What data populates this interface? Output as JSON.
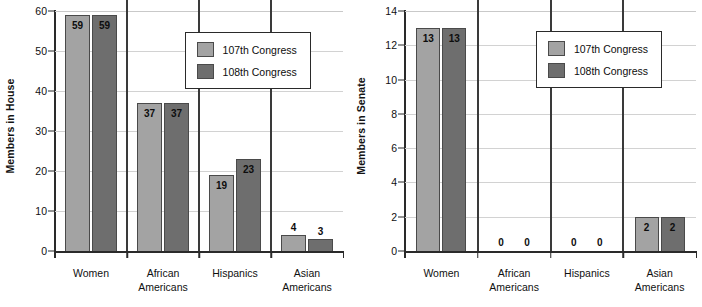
{
  "chart_data": [
    {
      "type": "bar",
      "id": "house",
      "title": "",
      "xlabel": "",
      "ylabel": "Members in House",
      "ylim": [
        0,
        60
      ],
      "yticks": [
        0,
        10,
        20,
        30,
        40,
        50,
        60
      ],
      "grid": true,
      "legend_position": "upper-right",
      "categories": [
        "Women",
        "African\nAmericans",
        "Hispanics",
        "Asian\nAmericans"
      ],
      "category_lines": [
        [
          "Women"
        ],
        [
          "African",
          "Americans"
        ],
        [
          "Hispanics"
        ],
        [
          "Asian",
          "Americans"
        ]
      ],
      "series": [
        {
          "name": "107th Congress",
          "color": "#a3a3a3",
          "values": [
            59,
            37,
            19,
            4
          ]
        },
        {
          "name": "108th Congress",
          "color": "#6e6e6e",
          "values": [
            59,
            37,
            23,
            3
          ]
        }
      ]
    },
    {
      "type": "bar",
      "id": "senate",
      "title": "",
      "xlabel": "",
      "ylabel": "Members in Senate",
      "ylim": [
        0,
        14
      ],
      "yticks": [
        0,
        2,
        4,
        6,
        8,
        10,
        12,
        14
      ],
      "grid": true,
      "legend_position": "upper-right",
      "categories": [
        "Women",
        "African\nAmericans",
        "Hispanics",
        "Asian\nAmericans"
      ],
      "category_lines": [
        [
          "Women"
        ],
        [
          "African",
          "Americans"
        ],
        [
          "Hispanics"
        ],
        [
          "Asian",
          "Americans"
        ]
      ],
      "series": [
        {
          "name": "107th Congress",
          "color": "#a3a3a3",
          "values": [
            13,
            0,
            0,
            2
          ]
        },
        {
          "name": "108th Congress",
          "color": "#6e6e6e",
          "values": [
            13,
            0,
            0,
            2
          ]
        }
      ]
    }
  ],
  "colors": {
    "series_107th": "#a3a3a3",
    "series_108th": "#6e6e6e",
    "axis": "#2a2a2a",
    "gridline": "#d2d2d2",
    "background": "#ffffff"
  }
}
